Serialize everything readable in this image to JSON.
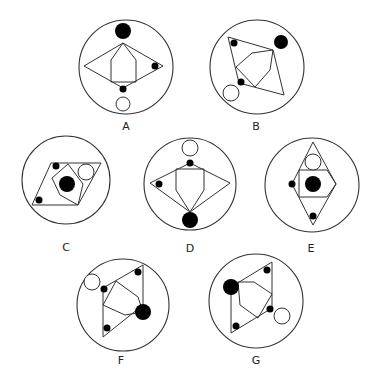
{
  "figures": [
    {
      "label": "A",
      "circle": {
        "cx": 126,
        "cy": 67,
        "r": 47
      },
      "label_pos": {
        "x": 126,
        "y": 130
      },
      "outer_polygon": "84,66 123,43 163,66 123,88",
      "inner_polygon": "123,43 136,60 136,82 111,82 111,60",
      "big_dot": {
        "cx": 123,
        "cy": 31,
        "r": 8
      },
      "small_dots": [
        {
          "cx": 155,
          "cy": 66
        },
        {
          "cx": 123,
          "cy": 89
        }
      ],
      "open_dot": {
        "cx": 123,
        "cy": 104,
        "r": 7
      }
    },
    {
      "label": "B",
      "circle": {
        "cx": 257,
        "cy": 67,
        "r": 47
      },
      "label_pos": {
        "x": 256,
        "y": 130
      },
      "outer_polygon": "228,37 273,50 284,95 239,83",
      "inner_polygon": "273,50 252,53 236,67 255,87 270,70",
      "big_dot": {
        "cx": 281,
        "cy": 42,
        "r": 7
      },
      "small_dots": [
        {
          "cx": 234,
          "cy": 43
        },
        {
          "cx": 241,
          "cy": 82
        }
      ],
      "open_dot": {
        "cx": 231,
        "cy": 93,
        "r": 8
      }
    },
    {
      "label": "C",
      "circle": {
        "cx": 66,
        "cy": 180,
        "r": 44
      },
      "label_pos": {
        "x": 66,
        "y": 251
      },
      "outer_polygon": "51,163 101,163 78,205 32,205",
      "inner_polygon": "68,164 52,178 60,195 78,205 83,184",
      "big_dot": {
        "cx": 67,
        "cy": 184,
        "r": 8
      },
      "small_dots": [
        {
          "cx": 56,
          "cy": 166
        },
        {
          "cx": 39,
          "cy": 200
        }
      ],
      "open_dot": {
        "cx": 86,
        "cy": 172,
        "r": 8
      }
    },
    {
      "label": "D",
      "circle": {
        "cx": 190,
        "cy": 184,
        "r": 46
      },
      "label_pos": {
        "x": 190,
        "y": 252
      },
      "outer_polygon": "190,163 230,183 190,212 150,183",
      "inner_polygon": "176,169 204,169 204,190 190,212 176,190",
      "big_dot": {
        "cx": 190,
        "cy": 220,
        "r": 8
      },
      "small_dots": [
        {
          "cx": 190,
          "cy": 163
        },
        {
          "cx": 159,
          "cy": 184
        }
      ],
      "open_dot": {
        "cx": 190,
        "cy": 148,
        "r": 8
      }
    },
    {
      "label": "E",
      "circle": {
        "cx": 312,
        "cy": 185,
        "r": 47
      },
      "label_pos": {
        "x": 311,
        "y": 252
      },
      "outer_polygon": "313,142 336,184 313,225 292,184",
      "inner_polygon": "299,170 327,170 336,184 327,197 299,197",
      "big_dot": {
        "cx": 313,
        "cy": 184,
        "r": 8
      },
      "small_dots": [
        {
          "cx": 292,
          "cy": 184
        },
        {
          "cx": 313,
          "cy": 216
        }
      ],
      "open_dot": {
        "cx": 313,
        "cy": 162,
        "r": 8
      }
    },
    {
      "label": "F",
      "circle": {
        "cx": 123,
        "cy": 305,
        "r": 46
      },
      "label_pos": {
        "x": 121,
        "y": 364
      },
      "outer_polygon": "103,288 143,265 143,305 103,337",
      "inner_polygon": "116,281 138,297 143,312 125,315 103,305",
      "big_dot": {
        "cx": 143,
        "cy": 312,
        "r": 8
      },
      "small_dots": [
        {
          "cx": 138,
          "cy": 272
        },
        {
          "cx": 104,
          "cy": 289
        },
        {
          "cx": 107,
          "cy": 328
        }
      ],
      "open_dot": {
        "cx": 92,
        "cy": 282,
        "r": 8
      }
    },
    {
      "label": "G",
      "circle": {
        "cx": 256,
        "cy": 301,
        "r": 47
      },
      "label_pos": {
        "x": 256,
        "y": 364
      },
      "outer_polygon": "231,287 272,262 272,308 231,333",
      "inner_polygon": "238,282 254,282 272,294 258,318 240,305",
      "big_dot": {
        "cx": 231,
        "cy": 287,
        "r": 8
      },
      "small_dots": [
        {
          "cx": 267,
          "cy": 270
        },
        {
          "cx": 270,
          "cy": 309
        },
        {
          "cx": 236,
          "cy": 326
        }
      ],
      "open_dot": {
        "cx": 282,
        "cy": 316,
        "r": 8
      }
    }
  ]
}
